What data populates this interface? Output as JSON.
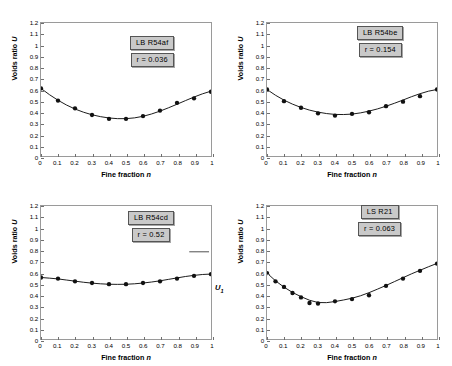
{
  "figure": {
    "axis_titles": {
      "x": "Fine fraction",
      "x_symbol": "n",
      "y": "Voids ratio",
      "y_symbol": "U"
    },
    "x_ticks": [
      "0",
      "0.1",
      "0.2",
      "0.3",
      "0.4",
      "0.5",
      "0.6",
      "0.7",
      "0.8",
      "0.9",
      "1"
    ],
    "y_ticks": [
      "0",
      "0.1",
      "0.2",
      "0.3",
      "0.4",
      "0.5",
      "0.6",
      "0.7",
      "0.8",
      "0.9",
      "1",
      "1.1",
      "1.2"
    ],
    "annotation_u1": "U",
    "annotation_u1_sub": "1"
  },
  "chart_data": [
    {
      "type": "scatter",
      "panel": "top-left",
      "title": "LB  R54af",
      "r_label": "r = 0.036",
      "r_value": 0.036,
      "xlabel": "Fine fraction n",
      "ylabel": "Voids ratio U",
      "xlim": [
        0,
        1
      ],
      "ylim": [
        0,
        1.2
      ],
      "grid": false,
      "legend": "none",
      "x": [
        0,
        0.1,
        0.2,
        0.3,
        0.4,
        0.5,
        0.6,
        0.7,
        0.8,
        0.9,
        1
      ],
      "values": [
        0.61,
        0.5,
        0.43,
        0.37,
        0.335,
        0.335,
        0.36,
        0.41,
        0.48,
        0.52,
        0.58
      ],
      "fit_curve": {
        "x": [
          0,
          0.05,
          0.1,
          0.15,
          0.2,
          0.25,
          0.3,
          0.35,
          0.4,
          0.45,
          0.5,
          0.55,
          0.6,
          0.65,
          0.7,
          0.75,
          0.8,
          0.85,
          0.9,
          0.95,
          1
        ],
        "y": [
          0.61,
          0.553,
          0.503,
          0.46,
          0.424,
          0.395,
          0.372,
          0.355,
          0.343,
          0.337,
          0.337,
          0.344,
          0.358,
          0.379,
          0.405,
          0.435,
          0.467,
          0.5,
          0.532,
          0.561,
          0.585
        ]
      }
    },
    {
      "type": "scatter",
      "panel": "top-right",
      "title": "LB R54be",
      "r_label": "r = 0.154",
      "r_value": 0.154,
      "xlabel": "Fine fraction n",
      "ylabel": "Voids ratio U",
      "xlim": [
        0,
        1
      ],
      "ylim": [
        0,
        1.2
      ],
      "grid": false,
      "legend": "none",
      "x": [
        0,
        0.1,
        0.2,
        0.3,
        0.4,
        0.5,
        0.6,
        0.7,
        0.8,
        0.9,
        1
      ],
      "values": [
        0.6,
        0.495,
        0.435,
        0.385,
        0.365,
        0.38,
        0.395,
        0.45,
        0.49,
        0.54,
        0.6
      ],
      "fit_curve": {
        "x": [
          0,
          0.05,
          0.1,
          0.15,
          0.2,
          0.25,
          0.3,
          0.35,
          0.4,
          0.45,
          0.5,
          0.55,
          0.6,
          0.65,
          0.7,
          0.75,
          0.8,
          0.85,
          0.9,
          0.95,
          1
        ],
        "y": [
          0.6,
          0.548,
          0.504,
          0.468,
          0.438,
          0.414,
          0.396,
          0.383,
          0.375,
          0.374,
          0.378,
          0.389,
          0.405,
          0.425,
          0.449,
          0.476,
          0.505,
          0.535,
          0.562,
          0.585,
          0.6
        ]
      }
    },
    {
      "type": "scatter",
      "panel": "bottom-left",
      "title": "LB  R54cd",
      "r_label": "r = 0.52",
      "r_value": 0.52,
      "xlabel": "Fine fraction n",
      "ylabel": "Voids ratio U",
      "xlim": [
        0,
        1
      ],
      "ylim": [
        0,
        1.2
      ],
      "grid": false,
      "legend": "none",
      "x": [
        0,
        0.1,
        0.2,
        0.3,
        0.4,
        0.5,
        0.6,
        0.7,
        0.8,
        0.9,
        1
      ],
      "values": [
        0.555,
        0.545,
        0.52,
        0.505,
        0.495,
        0.495,
        0.505,
        0.52,
        0.545,
        0.57,
        0.585
      ],
      "fit_curve": {
        "x": [
          0,
          0.05,
          0.1,
          0.15,
          0.2,
          0.25,
          0.3,
          0.35,
          0.4,
          0.45,
          0.5,
          0.55,
          0.6,
          0.65,
          0.7,
          0.75,
          0.8,
          0.85,
          0.9,
          0.95,
          1
        ],
        "y": [
          0.555,
          0.549,
          0.542,
          0.532,
          0.522,
          0.512,
          0.504,
          0.498,
          0.494,
          0.493,
          0.494,
          0.498,
          0.505,
          0.514,
          0.525,
          0.538,
          0.551,
          0.564,
          0.574,
          0.582,
          0.586
        ]
      }
    },
    {
      "type": "scatter",
      "panel": "bottom-right",
      "title": "LS  R21",
      "r_label": "r = 0.063",
      "r_value": 0.063,
      "xlabel": "Fine fraction n",
      "ylabel": "Voids ratio U",
      "xlim": [
        0,
        1
      ],
      "ylim": [
        0,
        1.2
      ],
      "grid": false,
      "legend": "none",
      "x": [
        0,
        0.05,
        0.1,
        0.15,
        0.2,
        0.25,
        0.3,
        0.4,
        0.5,
        0.6,
        0.7,
        0.8,
        0.9,
        1
      ],
      "values": [
        0.595,
        0.52,
        0.47,
        0.415,
        0.375,
        0.325,
        0.32,
        0.34,
        0.36,
        0.395,
        0.48,
        0.545,
        0.615,
        0.68
      ],
      "fit_curve": {
        "x": [
          0,
          0.05,
          0.1,
          0.15,
          0.2,
          0.25,
          0.3,
          0.35,
          0.4,
          0.45,
          0.5,
          0.55,
          0.6,
          0.65,
          0.7,
          0.75,
          0.8,
          0.85,
          0.9,
          0.95,
          1
        ],
        "y": [
          0.595,
          0.525,
          0.468,
          0.42,
          0.382,
          0.35,
          0.329,
          0.328,
          0.338,
          0.352,
          0.368,
          0.39,
          0.418,
          0.45,
          0.483,
          0.518,
          0.553,
          0.588,
          0.62,
          0.652,
          0.682
        ]
      }
    }
  ]
}
